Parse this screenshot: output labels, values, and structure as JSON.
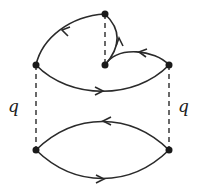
{
  "diagram": {
    "type": "feynman-diagram",
    "line_color": "#2a2a2a",
    "vertices": [
      {
        "id": "top",
        "x": 105,
        "y": 14
      },
      {
        "id": "mid",
        "x": 105,
        "y": 65
      },
      {
        "id": "left",
        "x": 36,
        "y": 65
      },
      {
        "id": "right",
        "x": 169,
        "y": 65
      },
      {
        "id": "bottom-left",
        "x": 36,
        "y": 150
      },
      {
        "id": "bottom-right",
        "x": 169,
        "y": 150
      }
    ],
    "labels": {
      "left_q": "q",
      "right_q": "q"
    },
    "edges": [
      {
        "from": "top",
        "to": "left",
        "style": "solid",
        "arrow": "toward left"
      },
      {
        "from": "mid",
        "to": "top",
        "style": "solid",
        "arrow": "upward"
      },
      {
        "from": "right",
        "to": "mid",
        "style": "solid",
        "arrow": "leftward"
      },
      {
        "from": "left",
        "to": "right",
        "style": "solid",
        "arrow": "rightward"
      },
      {
        "from": "top",
        "to": "mid",
        "style": "dashed"
      },
      {
        "from": "left",
        "to": "bottom-left",
        "style": "dashed",
        "label": "q"
      },
      {
        "from": "right",
        "to": "bottom-right",
        "style": "dashed",
        "label": "q"
      },
      {
        "from": "bottom-right",
        "to": "bottom-left",
        "style": "solid",
        "arrow": "leftward",
        "curve": "upper"
      },
      {
        "from": "bottom-left",
        "to": "bottom-right",
        "style": "solid",
        "arrow": "rightward",
        "curve": "lower"
      }
    ]
  }
}
